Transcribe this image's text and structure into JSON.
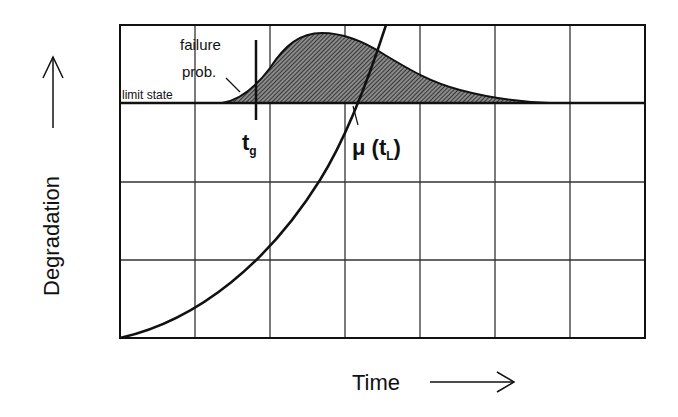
{
  "diagram": {
    "type": "degradation-vs-time",
    "axes": {
      "x_label": "Time",
      "y_label": "Degradation",
      "x_arrow": "right-arrow",
      "y_arrow": "up-arrow"
    },
    "grid": {
      "columns": 7,
      "rows": 4
    },
    "annotations": {
      "failure_line1": "failure",
      "failure_line2": "prob.",
      "limit_state": "limit state",
      "t_g_main": "t",
      "t_g_sub": "g",
      "mu_main": "μ (t",
      "mu_sub": "L",
      "mu_close": ")"
    },
    "colors": {
      "ink": "#111111",
      "grid": "#333333",
      "hatch_fill": "#555555",
      "background": "#ffffff"
    }
  }
}
